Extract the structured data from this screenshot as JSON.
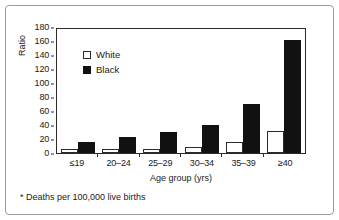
{
  "chart_data": {
    "type": "bar",
    "title": "",
    "xlabel": "Age group (yrs)",
    "ylabel": "Ratio",
    "categories": [
      "≤19",
      "20–24",
      "25–29",
      "30–34",
      "35–39",
      "≥40"
    ],
    "series": [
      {
        "name": "White",
        "color": "#ffffff",
        "values": [
          6,
          6,
          6,
          9,
          16,
          31
        ]
      },
      {
        "name": "Black",
        "color": "#111111",
        "values": [
          16,
          23,
          30,
          40,
          70,
          161
        ]
      }
    ],
    "ylim": [
      0,
      180
    ],
    "ytick_step": 20,
    "yticks": [
      180,
      160,
      140,
      120,
      100,
      80,
      60,
      40,
      20,
      0
    ],
    "grid": false,
    "legend_position": "upper-left-inside",
    "footnote": "* Deaths per 100,000 live births"
  },
  "legend": {
    "items": [
      {
        "label": "White",
        "swatch": "white-square-icon"
      },
      {
        "label": "Black",
        "swatch": "black-square-icon"
      }
    ]
  },
  "axes": {
    "y_title": "Ratio",
    "x_title": "Age group (yrs)"
  },
  "footnote": {
    "text": "* Deaths per 100,000 live births"
  }
}
